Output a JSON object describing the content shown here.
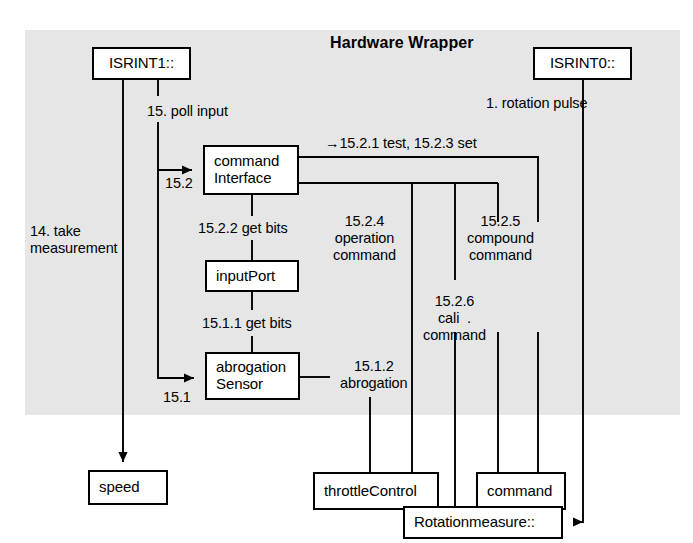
{
  "canvas": {
    "width": 693,
    "height": 543,
    "background": "#ffffff"
  },
  "panel": {
    "title": "Hardware Wrapper",
    "fill": "#e6e6e6",
    "x": 25,
    "y": 30,
    "width": 655,
    "height": 385
  },
  "line_color": "#000000",
  "nodes": [
    {
      "id": "isrint1",
      "label_lines": [
        "ISRINT1::"
      ],
      "x": 92,
      "y": 47,
      "w": 99,
      "h": 33,
      "align": "center"
    },
    {
      "id": "isrint0",
      "label_lines": [
        "ISRINT0::"
      ],
      "x": 533,
      "y": 47,
      "w": 99,
      "h": 33,
      "align": "center"
    },
    {
      "id": "command-interface",
      "label_lines": [
        "command",
        "Interface"
      ],
      "x": 203,
      "y": 145,
      "w": 96,
      "h": 50,
      "align": "left"
    },
    {
      "id": "input-port",
      "label_lines": [
        "inputPort"
      ],
      "x": 205,
      "y": 260,
      "w": 94,
      "h": 32,
      "align": "left"
    },
    {
      "id": "abrogation-sensor",
      "label_lines": [
        "abrogation",
        "Sensor"
      ],
      "x": 205,
      "y": 352,
      "w": 95,
      "h": 48,
      "align": "left"
    },
    {
      "id": "speed",
      "label_lines": [
        "speed"
      ],
      "x": 88,
      "y": 470,
      "w": 80,
      "h": 35,
      "align": "left"
    },
    {
      "id": "throttle-control",
      "label_lines": [
        "throttleControl"
      ],
      "x": 313,
      "y": 472,
      "w": 126,
      "h": 38,
      "align": "left"
    },
    {
      "id": "command",
      "label_lines": [
        "command"
      ],
      "x": 476,
      "y": 472,
      "w": 90,
      "h": 38,
      "align": "left"
    },
    {
      "id": "rotation-measure",
      "label_lines": [
        "Rotationmeasure::"
      ],
      "x": 403,
      "y": 506,
      "w": 160,
      "h": 33,
      "align": "left"
    }
  ],
  "edge_labels": [
    {
      "id": "poll-input",
      "text": "15. poll input",
      "x": 147,
      "y": 103,
      "align": "left"
    },
    {
      "id": "rotation-pulse",
      "text": "1. rotation pulse",
      "x": 486,
      "y": 95,
      "align": "left"
    },
    {
      "id": "test-set",
      "text": "→15.2.1 test, 15.2.3 set",
      "x": 325,
      "y": 135,
      "align": "left"
    },
    {
      "id": "label-15-2",
      "text": "15.2",
      "x": 165,
      "y": 175,
      "align": "left"
    },
    {
      "id": "get-bits-1522",
      "text": "15.2.2 get bits",
      "x": 198,
      "y": 220,
      "align": "left"
    },
    {
      "id": "operation-command",
      "text": "15.2.4\noperation\ncommand",
      "x": 333,
      "y": 213,
      "align": "center"
    },
    {
      "id": "compound-command",
      "text": "15.2.5\ncompound\ncommand",
      "x": 467,
      "y": 213,
      "align": "center"
    },
    {
      "id": "take-measurement",
      "text": "14. take\nmeasurement",
      "x": 30,
      "y": 223,
      "align": "left"
    },
    {
      "id": "get-bits-1511",
      "text": "15.1.1 get bits",
      "x": 202,
      "y": 315,
      "align": "left"
    },
    {
      "id": "cali-command",
      "text": "15.2.6\ncali  .\ncommand",
      "x": 423,
      "y": 293,
      "align": "center"
    },
    {
      "id": "label-15-1",
      "text": "15.1",
      "x": 163,
      "y": 389,
      "align": "left"
    },
    {
      "id": "abrogation-1512",
      "text": "15.1.2\nabrogation",
      "x": 340,
      "y": 358,
      "align": "center"
    }
  ],
  "connections": [
    {
      "id": "isrint1-to-speed",
      "from": "isrint1",
      "to": "speed",
      "arrow": "down"
    },
    {
      "id": "isrint1-to-command-iface",
      "from": "isrint1",
      "to": "command-interface",
      "arrow": "right",
      "label": "15.2"
    },
    {
      "id": "isrint1-to-abrogation",
      "from": "isrint1",
      "to": "abrogation-sensor",
      "arrow": "right",
      "label": "15.1"
    },
    {
      "id": "command-iface-to-input-port",
      "from": "command-interface",
      "to": "input-port",
      "arrow": "none"
    },
    {
      "id": "input-port-to-abrogation",
      "from": "input-port",
      "to": "abrogation-sensor",
      "arrow": "none"
    },
    {
      "id": "command-iface-to-command",
      "from": "command-interface",
      "to": "command",
      "arrow": "none"
    },
    {
      "id": "command-iface-to-throttle",
      "from": "command-interface",
      "to": "throttle-control",
      "arrow": "none"
    },
    {
      "id": "command-iface-to-rotation",
      "from": "command-interface",
      "to": "rotation-measure",
      "arrow": "none"
    },
    {
      "id": "abrogation-to-throttle",
      "from": "abrogation-sensor",
      "to": "throttle-control",
      "arrow": "none"
    },
    {
      "id": "isrint0-to-rotation",
      "from": "isrint0",
      "to": "rotation-measure",
      "arrow": "left"
    }
  ]
}
